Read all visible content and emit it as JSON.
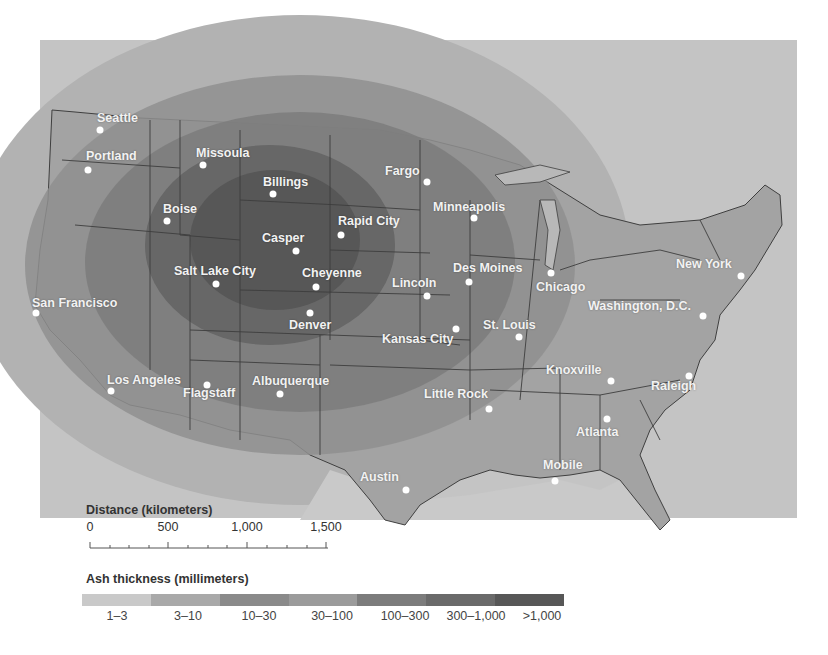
{
  "map": {
    "subject": "Volcanic ash thickness distribution over contiguous United States",
    "cities": [
      {
        "name": "Seattle",
        "label": "Seattle",
        "dot": [
          100,
          130
        ],
        "label_pos": [
          97,
          111
        ]
      },
      {
        "name": "Portland",
        "label": "Portland",
        "dot": [
          88,
          170
        ],
        "label_pos": [
          86,
          149
        ]
      },
      {
        "name": "Missoula",
        "label": "Missoula",
        "dot": [
          203,
          165
        ],
        "label_pos": [
          196,
          146
        ]
      },
      {
        "name": "Billings",
        "label": "Billings",
        "dot": [
          273,
          194
        ],
        "label_pos": [
          263,
          175
        ]
      },
      {
        "name": "Boise",
        "label": "Boise",
        "dot": [
          167,
          221
        ],
        "label_pos": [
          163,
          202
        ]
      },
      {
        "name": "Casper",
        "label": "Casper",
        "dot": [
          296,
          251
        ],
        "label_pos": [
          262,
          231
        ]
      },
      {
        "name": "Rapid City",
        "label": "Rapid City",
        "dot": [
          341,
          235
        ],
        "label_pos": [
          338,
          214
        ]
      },
      {
        "name": "Fargo",
        "label": "Fargo",
        "dot": [
          427,
          182
        ],
        "label_pos": [
          385,
          164
        ]
      },
      {
        "name": "Minneapolis",
        "label": "Minneapolis",
        "dot": [
          474,
          218
        ],
        "label_pos": [
          433,
          200
        ]
      },
      {
        "name": "Salt Lake City",
        "label": "Salt Lake City",
        "dot": [
          216,
          284
        ],
        "label_pos": [
          174,
          264
        ]
      },
      {
        "name": "Cheyenne",
        "label": "Cheyenne",
        "dot": [
          316,
          287
        ],
        "label_pos": [
          302,
          266
        ]
      },
      {
        "name": "Denver",
        "label": "Denver",
        "dot": [
          310,
          313
        ],
        "label_pos": [
          289,
          318
        ]
      },
      {
        "name": "Lincoln",
        "label": "Lincoln",
        "dot": [
          427,
          296
        ],
        "label_pos": [
          392,
          276
        ]
      },
      {
        "name": "Des Moines",
        "label": "Des Moines",
        "dot": [
          469,
          282
        ],
        "label_pos": [
          453,
          275
        ]
      },
      {
        "name": "Chicago",
        "label": "Chicago",
        "dot": [
          551,
          273
        ],
        "label_pos": [
          536,
          280
        ]
      },
      {
        "name": "San Francisco",
        "label": "San Francisco",
        "dot": [
          36,
          313
        ],
        "label_pos": [
          32,
          296
        ]
      },
      {
        "name": "Kansas City",
        "label": "Kansas City",
        "dot": [
          456,
          329
        ],
        "label_pos": [
          382,
          332
        ]
      },
      {
        "name": "St. Louis",
        "label": "St. Louis",
        "dot": [
          519,
          337
        ],
        "label_pos": [
          483,
          318
        ]
      },
      {
        "name": "New York",
        "label": "New York",
        "dot": [
          741,
          276
        ],
        "label_pos": [
          676,
          257
        ]
      },
      {
        "name": "Washington, D.C.",
        "label": "Washington, D.C.",
        "dot": [
          703,
          316
        ],
        "label_pos": [
          588,
          299
        ]
      },
      {
        "name": "Los Angeles",
        "label": "Los Angeles",
        "dot": [
          111,
          391
        ],
        "label_pos": [
          107,
          373
        ]
      },
      {
        "name": "Flagstaff",
        "label": "Flagstaff",
        "dot": [
          207,
          385
        ],
        "label_pos": [
          183,
          386
        ]
      },
      {
        "name": "Albuquerque",
        "label": "Albuquerque",
        "dot": [
          280,
          394
        ],
        "label_pos": [
          252,
          374
        ]
      },
      {
        "name": "Little Rock",
        "label": "Little Rock",
        "dot": [
          489,
          409
        ],
        "label_pos": [
          424,
          387
        ]
      },
      {
        "name": "Knoxville",
        "label": "Knoxville",
        "dot": [
          611,
          381
        ],
        "label_pos": [
          546,
          363
        ]
      },
      {
        "name": "Raleigh",
        "label": "Raleigh",
        "dot": [
          689,
          376
        ],
        "label_pos": [
          651,
          379
        ]
      },
      {
        "name": "Atlanta",
        "label": "Atlanta",
        "dot": [
          607,
          419
        ],
        "label_pos": [
          576,
          425
        ]
      },
      {
        "name": "Austin",
        "label": "Austin",
        "dot": [
          406,
          490
        ],
        "label_pos": [
          360,
          470
        ]
      },
      {
        "name": "Mobile",
        "label": "Mobile",
        "dot": [
          555,
          481
        ],
        "label_pos": [
          543,
          458
        ]
      }
    ]
  },
  "scale": {
    "title": "Distance (kilometers)",
    "ticks": [
      {
        "label": "0",
        "x": 90
      },
      {
        "label": "500",
        "x": 168
      },
      {
        "label": "1,000",
        "x": 247
      },
      {
        "label": "1,500",
        "x": 326
      }
    ]
  },
  "legend": {
    "title": "Ash thickness (millimeters)",
    "categories": [
      {
        "label": "1–3",
        "color": "#c9c9c9"
      },
      {
        "label": "3–10",
        "color": "#a9a9a9"
      },
      {
        "label": "10–30",
        "color": "#8a8a8a"
      },
      {
        "label": "30–100",
        "color": "#9b9b9b"
      },
      {
        "label": "100–300",
        "color": "#7c7c7c"
      },
      {
        "label": "300–1,000",
        "color": "#6a6a6a"
      },
      {
        "label": ">1,000",
        "color": "#575757"
      }
    ]
  },
  "colors": {
    "background": "#ffffff",
    "land_base": "#a6a6a6",
    "outer_1_3": "#c4c4c4",
    "ring_3_10": "#b0b0b0",
    "ring_10_30": "#8f8f8f",
    "ring_30_100": "#7e7e7e",
    "ring_100_300": "#6b6b6b",
    "core_300_1000": "#585858",
    "state_lines": "#3f3f3f"
  }
}
